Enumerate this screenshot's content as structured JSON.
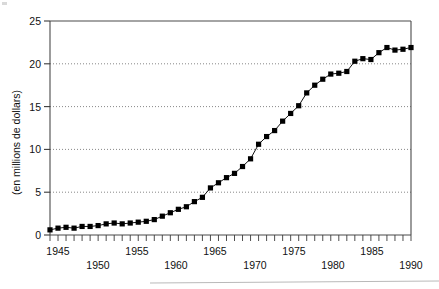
{
  "figure": {
    "ylabel": "(en millions de dollars)",
    "axis_color": "#4a4a4a",
    "series_color": "#000000",
    "grid_color": "#555555"
  },
  "axes": {
    "y_ticks": [
      "0",
      "5",
      "10",
      "15",
      "20",
      "25"
    ],
    "x_ticks_upper": [
      "1945",
      "1955",
      "1965",
      "1975",
      "1985"
    ],
    "x_ticks_lower": [
      "1950",
      "1960",
      "1970",
      "1980",
      "1990"
    ]
  },
  "chart_data": {
    "type": "line",
    "title": "",
    "xlabel": "",
    "ylabel": "(en millions de dollars)",
    "xlim": [
      1945,
      1990
    ],
    "ylim": [
      0,
      25
    ],
    "grid": true,
    "grid_axis": "y",
    "grid_values": [
      5,
      10,
      15,
      20
    ],
    "legend": "none",
    "marker": "square",
    "x": [
      1945,
      1946,
      1947,
      1948,
      1949,
      1950,
      1951,
      1952,
      1953,
      1954,
      1955,
      1956,
      1957,
      1958,
      1959,
      1960,
      1961,
      1962,
      1963,
      1964,
      1965,
      1966,
      1967,
      1968,
      1969,
      1970,
      1971,
      1972,
      1973,
      1974,
      1975,
      1976,
      1977,
      1978,
      1979,
      1980,
      1981,
      1982,
      1983,
      1984,
      1985,
      1986,
      1987,
      1988,
      1989,
      1990
    ],
    "values": [
      0.6,
      0.8,
      0.9,
      0.8,
      1.0,
      1.0,
      1.1,
      1.3,
      1.4,
      1.3,
      1.4,
      1.5,
      1.6,
      1.8,
      2.2,
      2.6,
      3.0,
      3.3,
      3.9,
      4.4,
      5.5,
      6.1,
      6.7,
      7.2,
      8.0,
      8.9,
      10.6,
      11.5,
      12.2,
      13.3,
      14.2,
      15.1,
      16.6,
      17.5,
      18.2,
      18.8,
      18.9,
      19.1,
      20.3,
      20.6,
      20.5,
      21.3,
      21.9,
      21.6,
      21.7,
      21.9
    ],
    "series": [
      {
        "name": "series-1",
        "values": [
          0.6,
          0.8,
          0.9,
          0.8,
          1.0,
          1.0,
          1.1,
          1.3,
          1.4,
          1.3,
          1.4,
          1.5,
          1.6,
          1.8,
          2.2,
          2.6,
          3.0,
          3.3,
          3.9,
          4.4,
          5.5,
          6.1,
          6.7,
          7.2,
          8.0,
          8.9,
          10.6,
          11.5,
          12.2,
          13.3,
          14.2,
          15.1,
          16.6,
          17.5,
          18.2,
          18.8,
          18.9,
          19.1,
          20.3,
          20.6,
          20.5,
          21.3,
          21.9,
          21.6,
          21.7,
          21.9
        ]
      }
    ]
  }
}
